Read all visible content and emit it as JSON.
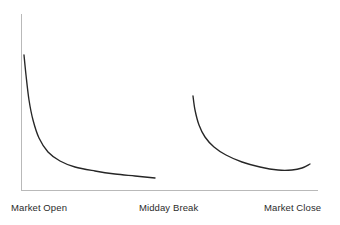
{
  "chart_data": {
    "type": "line",
    "title": "",
    "subtitle": "",
    "xlabel": "",
    "ylabel": "",
    "grid": false,
    "legend": false,
    "legend_position": "none",
    "xlim": [
      0,
      100
    ],
    "ylim": [
      0,
      100
    ],
    "x_tick_labels": [
      "Market Open",
      "Midday Break",
      "Market Close"
    ],
    "x_tick_positions": [
      0,
      45,
      100
    ],
    "y_tick_labels": [],
    "axis_color": "#b9b9b9",
    "series_color": "#262626",
    "series": [
      {
        "name": "Morning Session",
        "x": [
          1.0,
          1.6,
          2.4,
          3.5,
          5.0,
          7.0,
          9.5,
          12.5,
          16.0,
          20.0,
          25.0,
          30.0,
          35.0,
          40.0,
          45.0
        ],
        "y": [
          76.0,
          64.0,
          52.0,
          42.0,
          33.0,
          26.5,
          22.0,
          18.8,
          16.4,
          14.8,
          13.3,
          12.2,
          11.3,
          10.5,
          9.8
        ],
        "points": [
          {
            "x": 24,
            "y": 55
          },
          {
            "x": 26,
            "y": 75
          },
          {
            "x": 29,
            "y": 100
          },
          {
            "x": 33,
            "y": 120
          },
          {
            "x": 39,
            "y": 138
          },
          {
            "x": 48,
            "y": 152
          },
          {
            "x": 60,
            "y": 161
          },
          {
            "x": 75,
            "y": 167
          },
          {
            "x": 95,
            "y": 171
          },
          {
            "x": 115,
            "y": 174
          },
          {
            "x": 135,
            "y": 176
          },
          {
            "x": 155,
            "y": 178
          }
        ]
      },
      {
        "name": "Afternoon Session",
        "x": [
          55.0,
          55.6,
          56.5,
          57.8,
          59.5,
          61.5,
          64.0,
          67.0,
          71.0,
          76.0,
          82.0,
          88.0,
          93.0,
          97.0,
          100.0
        ],
        "y": [
          57.0,
          50.0,
          43.0,
          37.0,
          31.5,
          27.0,
          23.5,
          20.5,
          17.8,
          15.5,
          13.6,
          12.4,
          12.0,
          12.4,
          13.4
        ],
        "points": [
          {
            "x": 193,
            "y": 96
          },
          {
            "x": 195,
            "y": 110
          },
          {
            "x": 199,
            "y": 125
          },
          {
            "x": 205,
            "y": 137
          },
          {
            "x": 214,
            "y": 147
          },
          {
            "x": 226,
            "y": 155
          },
          {
            "x": 242,
            "y": 162
          },
          {
            "x": 260,
            "y": 167
          },
          {
            "x": 278,
            "y": 170
          },
          {
            "x": 292,
            "y": 170
          },
          {
            "x": 302,
            "y": 168
          },
          {
            "x": 310,
            "y": 164
          }
        ]
      }
    ],
    "annotations": [],
    "axes": {
      "y_axis": {
        "x": 21,
        "y_top": 14,
        "y_bottom": 190
      },
      "x_axis": {
        "y": 190,
        "x_left": 21,
        "x_right": 318
      }
    }
  }
}
